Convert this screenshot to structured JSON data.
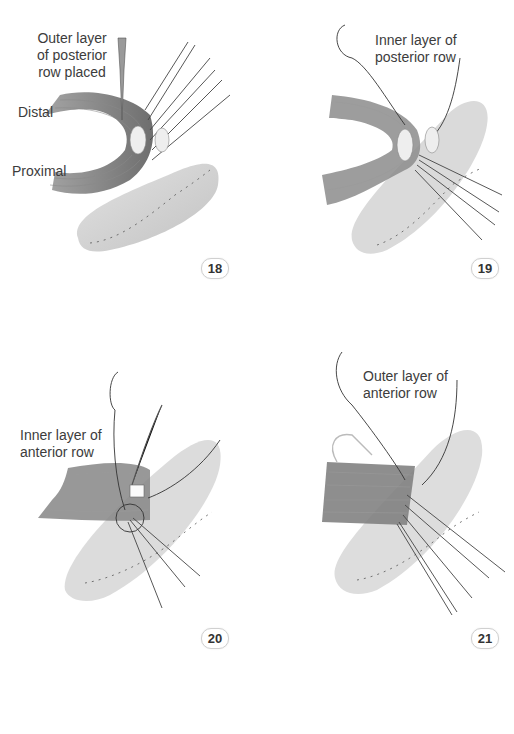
{
  "figures": [
    {
      "number": "18",
      "labels": {
        "title": "Outer layer\nof posterior\nrow placed",
        "distal": "Distal",
        "proximal": "Proximal"
      }
    },
    {
      "number": "19",
      "labels": {
        "title": "Inner layer of\nposterior row"
      }
    },
    {
      "number": "20",
      "labels": {
        "title": "Inner layer of\nanterior row"
      }
    },
    {
      "number": "21",
      "labels": {
        "title": "Outer layer of\nanterior row"
      }
    }
  ],
  "colors": {
    "tissue_dark": "#7a7a7a",
    "tissue_light": "#d8d8d8",
    "suture": "#2e2e2e",
    "background": "#ffffff"
  }
}
